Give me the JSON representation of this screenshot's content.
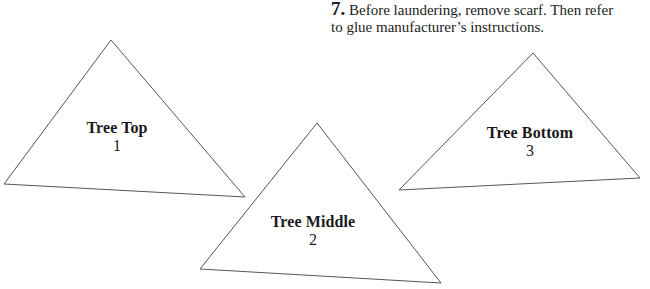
{
  "instruction": {
    "step_number": "7.",
    "text_line1": "Before laundering, remove scarf. Then refer",
    "text_line2": "to glue manufacturer’s instructions."
  },
  "pieces": [
    {
      "name": "Tree Top",
      "number": "1",
      "points": "111,40 4,184 245,197"
    },
    {
      "name": "Tree Middle",
      "number": "2",
      "points": "317,123 200,269 441,283"
    },
    {
      "name": "Tree Bottom",
      "number": "3",
      "points": "533,53 399,190 640,178"
    }
  ],
  "colors": {
    "stroke": "#555555",
    "text": "#1a1a1a"
  }
}
